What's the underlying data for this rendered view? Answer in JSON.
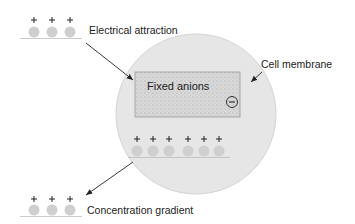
{
  "diagram": {
    "labels": {
      "electrical_attraction": "Electrical attraction",
      "cell_membrane": "Cell membrane",
      "fixed_anions": "Fixed anions",
      "concentration_gradient": "Concentration gradient"
    },
    "symbols": {
      "cation_charge": "+",
      "anion_charge": "−"
    },
    "groups": {
      "top_left_cations": 3,
      "inside_cell_cations": 6,
      "bottom_left_cations": 3
    },
    "colors": {
      "cell_fill": "#e6e6e6",
      "box_fill": "#d6d6d6",
      "ion_fill": "#cfcfcf",
      "line": "#333333"
    }
  }
}
